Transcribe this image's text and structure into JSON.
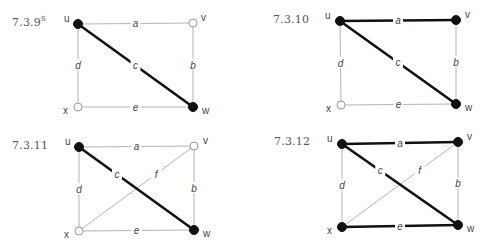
{
  "colors": {
    "thin_edge": "#b5b5b5",
    "thick_edge": "#111111",
    "filled_vertex": "#111111",
    "open_vertex_fill": "#ffffff",
    "open_vertex_stroke": "#999999",
    "label": "#444444"
  },
  "figures": [
    {
      "id": "7.3.9",
      "label": "7.3.9",
      "label_sup": "S",
      "label_pos": [
        12,
        15
      ],
      "vertices": {
        "u": {
          "pos": [
            78,
            24
          ],
          "filled": true,
          "label_offset": [
            -14,
            -2
          ]
        },
        "v": {
          "pos": [
            193,
            23
          ],
          "filled": false,
          "label_offset": [
            8,
            -2
          ]
        },
        "w": {
          "pos": [
            193,
            107
          ],
          "filled": true,
          "label_offset": [
            9,
            7
          ]
        },
        "x": {
          "pos": [
            78,
            107
          ],
          "filled": false,
          "label_offset": [
            -15,
            7
          ]
        }
      },
      "edges": [
        {
          "name": "a",
          "from": "u",
          "to": "v",
          "thick": false
        },
        {
          "name": "b",
          "from": "v",
          "to": "w",
          "thick": false
        },
        {
          "name": "c",
          "from": "u",
          "to": "w",
          "thick": true
        },
        {
          "name": "d",
          "from": "u",
          "to": "x",
          "thick": false
        },
        {
          "name": "e",
          "from": "x",
          "to": "w",
          "thick": false
        }
      ]
    },
    {
      "id": "7.3.10",
      "label": "7.3.10",
      "label_sup": "",
      "label_pos": [
        273,
        13
      ],
      "vertices": {
        "u": {
          "pos": [
            340,
            21
          ],
          "filled": true,
          "label_offset": [
            -15,
            -2
          ]
        },
        "v": {
          "pos": [
            456,
            20
          ],
          "filled": true,
          "label_offset": [
            9,
            -2
          ]
        },
        "w": {
          "pos": [
            456,
            104
          ],
          "filled": true,
          "label_offset": [
            9,
            7
          ]
        },
        "x": {
          "pos": [
            341,
            105
          ],
          "filled": false,
          "label_offset": [
            -15,
            7
          ]
        }
      },
      "edges": [
        {
          "name": "a",
          "from": "u",
          "to": "v",
          "thick": true
        },
        {
          "name": "b",
          "from": "v",
          "to": "w",
          "thick": false
        },
        {
          "name": "c",
          "from": "u",
          "to": "w",
          "thick": true
        },
        {
          "name": "d",
          "from": "u",
          "to": "x",
          "thick": false
        },
        {
          "name": "e",
          "from": "x",
          "to": "w",
          "thick": false
        }
      ]
    },
    {
      "id": "7.3.11",
      "label": "7.3.11",
      "label_sup": "",
      "label_pos": [
        12,
        139
      ],
      "vertices": {
        "u": {
          "pos": [
            79,
            147
          ],
          "filled": true,
          "label_offset": [
            -14,
            -2
          ]
        },
        "v": {
          "pos": [
            194,
            146
          ],
          "filled": false,
          "label_offset": [
            9,
            -2
          ]
        },
        "w": {
          "pos": [
            194,
            230
          ],
          "filled": true,
          "label_offset": [
            9,
            7
          ]
        },
        "x": {
          "pos": [
            79,
            231
          ],
          "filled": false,
          "label_offset": [
            -15,
            7
          ]
        }
      },
      "edges": [
        {
          "name": "a",
          "from": "u",
          "to": "v",
          "thick": false
        },
        {
          "name": "b",
          "from": "v",
          "to": "w",
          "thick": false
        },
        {
          "name": "c",
          "from": "u",
          "to": "w",
          "thick": true
        },
        {
          "name": "d",
          "from": "u",
          "to": "x",
          "thick": false
        },
        {
          "name": "e",
          "from": "x",
          "to": "w",
          "thick": false
        },
        {
          "name": "f",
          "from": "x",
          "to": "v",
          "thick": false
        }
      ]
    },
    {
      "id": "7.3.12",
      "label": "7.3.12",
      "label_sup": "",
      "label_pos": [
        274,
        135
      ],
      "vertices": {
        "u": {
          "pos": [
            342,
            144
          ],
          "filled": true,
          "label_offset": [
            -15,
            -2
          ]
        },
        "v": {
          "pos": [
            458,
            142
          ],
          "filled": true,
          "label_offset": [
            9,
            -2
          ]
        },
        "w": {
          "pos": [
            458,
            225
          ],
          "filled": true,
          "label_offset": [
            9,
            7
          ]
        },
        "x": {
          "pos": [
            342,
            227
          ],
          "filled": true,
          "label_offset": [
            -15,
            7
          ]
        }
      },
      "edges": [
        {
          "name": "a",
          "from": "u",
          "to": "v",
          "thick": true
        },
        {
          "name": "b",
          "from": "v",
          "to": "w",
          "thick": false
        },
        {
          "name": "c",
          "from": "u",
          "to": "w",
          "thick": true
        },
        {
          "name": "d",
          "from": "u",
          "to": "x",
          "thick": false
        },
        {
          "name": "e",
          "from": "x",
          "to": "w",
          "thick": true
        },
        {
          "name": "f",
          "from": "x",
          "to": "v",
          "thick": false
        }
      ]
    }
  ]
}
